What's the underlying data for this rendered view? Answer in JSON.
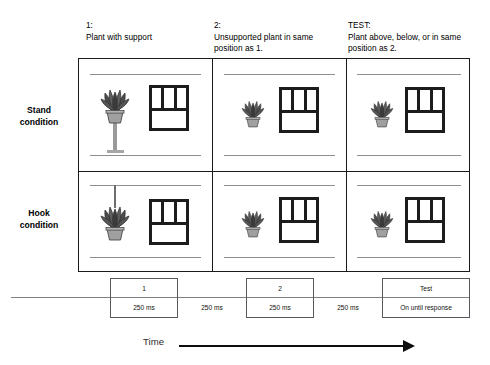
{
  "figure": {
    "columns": [
      {
        "number": "1:",
        "description": "Plant with support"
      },
      {
        "number": "2:",
        "description": "Unsupported plant in same position as 1."
      },
      {
        "number": "TEST:",
        "description": "Plant above, below, or in same position as 2."
      }
    ],
    "rows": [
      {
        "label": "Stand condition",
        "label_line1": "Stand",
        "label_line2": "condition",
        "support": "stand"
      },
      {
        "label": "Hook condition",
        "label_line1": "Hook",
        "label_line2": "condition",
        "support": "hook"
      }
    ],
    "cells": [
      {
        "row": "stand",
        "col": "1",
        "plant": "plant-supported-on-stand",
        "window": "window-6-pane",
        "support_visible": true
      },
      {
        "row": "stand",
        "col": "2",
        "plant": "plant-unsupported",
        "window": "window-6-pane",
        "support_visible": false
      },
      {
        "row": "stand",
        "col": "TEST",
        "plant": "plant-unsupported",
        "window": "window-6-pane",
        "support_visible": false
      },
      {
        "row": "hook",
        "col": "1",
        "plant": "plant-hanging-from-hook",
        "window": "window-6-pane",
        "support_visible": true
      },
      {
        "row": "hook",
        "col": "2",
        "plant": "plant-unsupported",
        "window": "window-6-pane",
        "support_visible": false
      },
      {
        "row": "hook",
        "col": "TEST",
        "plant": "plant-unsupported",
        "window": "window-6-pane",
        "support_visible": false
      }
    ],
    "timeline": {
      "events": [
        {
          "label": "1",
          "duration": "250 ms"
        },
        {
          "label": "2",
          "duration": "250 ms"
        },
        {
          "label": "Test",
          "duration": "On until response"
        }
      ],
      "gaps": [
        {
          "duration": "250 ms"
        },
        {
          "duration": "250 ms"
        }
      ]
    },
    "time_axis": {
      "label": "Time",
      "arrow": "right-arrow-icon"
    },
    "colors": {
      "grid_border": "#1a1a1a",
      "wall_line": "#8e8e8e",
      "window_frame": "#1c1c1c",
      "timeline_border": "#55585c",
      "baseline": "#808080",
      "arrow": "#0d0d0d",
      "plant_dark": "#4b4b4b",
      "pot": "#a0a0a0"
    }
  }
}
